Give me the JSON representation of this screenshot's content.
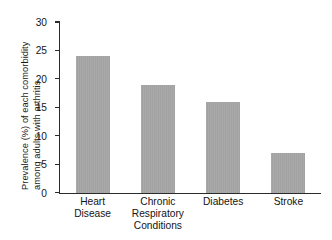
{
  "chart_data": {
    "type": "bar",
    "title": "",
    "subtitle": "",
    "xlabel": "",
    "ylabel": "Prevalence (%) of each comorbidity among adults with arthritis",
    "ylabel_lines": [
      "Prevalence (%) of each comorbidity",
      "among adults with arthritis"
    ],
    "categories": [
      "Heart Disease",
      "Chronic Respiratory Conditions",
      "Diabetes",
      "Stroke"
    ],
    "category_lines": [
      [
        "Heart",
        "Disease"
      ],
      [
        "Chronic",
        "Respiratory",
        "Conditions"
      ],
      [
        "Diabetes"
      ],
      [
        "Stroke"
      ]
    ],
    "values": [
      24,
      19,
      16,
      7
    ],
    "ylim": [
      0,
      30
    ],
    "yticks": [
      0,
      5,
      10,
      15,
      20,
      25,
      30
    ],
    "ytick_labels": [
      "0",
      "5",
      "10",
      "15",
      "20",
      "25",
      "30"
    ],
    "grid": false,
    "legend": null,
    "legend_position": "none",
    "bar_color": "#a8a8a8",
    "axis_color": "#2b2b2b",
    "text_color": "#141414",
    "background": "#ffffff"
  }
}
